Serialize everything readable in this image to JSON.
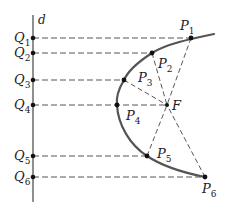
{
  "diagram": {
    "title": "",
    "directrix": {
      "label": "d",
      "x": 33,
      "y_top": 15,
      "y_bottom": 202
    },
    "focus": {
      "label": "F",
      "x": 167,
      "y": 105
    },
    "curve_color": "#555555",
    "line_color": "#333333",
    "q_points": [
      {
        "label": "Q",
        "sub": "1",
        "x": 33,
        "y": 38
      },
      {
        "label": "Q",
        "sub": "2",
        "x": 33,
        "y": 53
      },
      {
        "label": "Q",
        "sub": "3",
        "x": 33,
        "y": 80
      },
      {
        "label": "Q",
        "sub": "4",
        "x": 33,
        "y": 105
      },
      {
        "label": "Q",
        "sub": "5",
        "x": 33,
        "y": 156
      },
      {
        "label": "Q",
        "sub": "6",
        "x": 33,
        "y": 177
      }
    ],
    "p_points": [
      {
        "label": "P",
        "sub": "1",
        "x": 191,
        "y": 38
      },
      {
        "label": "P",
        "sub": "2",
        "x": 152,
        "y": 53
      },
      {
        "label": "P",
        "sub": "3",
        "x": 124,
        "y": 80
      },
      {
        "label": "P",
        "sub": "4",
        "x": 117,
        "y": 105
      },
      {
        "label": "P",
        "sub": "5",
        "x": 147,
        "y": 156
      },
      {
        "label": "P",
        "sub": "6",
        "x": 205,
        "y": 177
      }
    ]
  }
}
